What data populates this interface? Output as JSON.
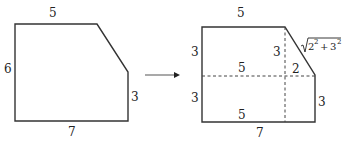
{
  "left_figure": {
    "labels": {
      "top": "5",
      "left": "6",
      "right": "3",
      "bottom": "7"
    }
  },
  "arrow": {
    "direction": "right"
  },
  "right_figure": {
    "labels": {
      "top": "5",
      "left_upper": "3",
      "left_lower": "3",
      "inner_vertical": "3",
      "inner_top_middle": "5",
      "inner_bottom_middle": "5",
      "inner_horizontal": "2",
      "right": "3",
      "bottom": "7",
      "hypotenuse_radicand_a": "2",
      "hypotenuse_radicand_b": "3",
      "hypotenuse_exponent": "2",
      "hypotenuse_plus": "+"
    }
  },
  "colors": {
    "stroke": "#333333",
    "text": "#222222"
  }
}
